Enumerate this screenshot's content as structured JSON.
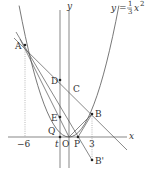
{
  "diagram": {
    "type": "coordinate-geometry",
    "curve": {
      "equation_label_lhs": "y =",
      "frac_num": "1",
      "frac_den": "3",
      "equation_label_rhs": "x",
      "exponent": "2",
      "formula": "y = (1/3)x^2"
    },
    "axes": {
      "x_label": "x",
      "y_label": "y",
      "origin_label": "O"
    },
    "tick_labels": {
      "neg_six": "−6",
      "three": "3",
      "t": "t"
    },
    "points": {
      "A": {
        "label": "A",
        "x": -6,
        "y": 12
      },
      "B": {
        "label": "B",
        "x": 3,
        "y": 3
      },
      "B_prime": {
        "label": "B'",
        "x": 3,
        "y": -3
      },
      "C": {
        "label": "C",
        "x": 0,
        "y": 6
      },
      "D": {
        "label": "D",
        "x": -1.2,
        "y": 7.2
      },
      "E": {
        "label": "E",
        "x": -1.2,
        "y": 2.4
      },
      "P": {
        "label": "P",
        "x": 1.2,
        "y": 0
      },
      "Q": {
        "label": "Q",
        "x": -1.2,
        "y": 0
      }
    },
    "lines": [
      "AB: y = -x + 6",
      "AB': y = -5/3 x + 2",
      "AO: y = -2x",
      "x = t (vertical)",
      "OB",
      "PB"
    ],
    "colors": {
      "stroke": "#555555",
      "text": "#333333",
      "dotted": "#888888"
    }
  }
}
